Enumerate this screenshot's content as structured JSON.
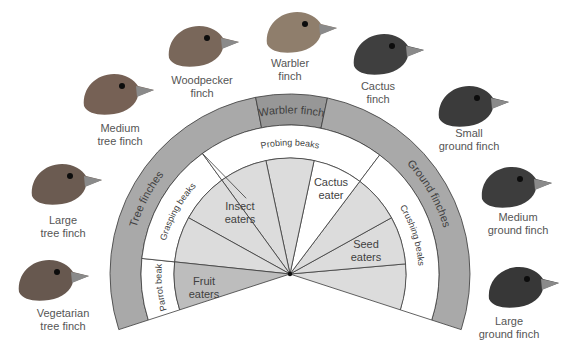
{
  "center": {
    "x": 290,
    "y": 274
  },
  "radii": {
    "outer": 180,
    "group_inner": 149,
    "beak_inner": 116
  },
  "colors": {
    "group_ring": "#a9a9a9",
    "warbler_band": "#979797",
    "diet_light": "#dcdcdc",
    "diet_fruit": "#bdbdbd",
    "white": "#ffffff",
    "stroke": "#3a3a3a",
    "label": "#3f3f3f"
  },
  "groups": [
    {
      "label": "Tree finches",
      "start": 101,
      "end": 198
    },
    {
      "label": "Warbler finch",
      "start": 78,
      "end": 101
    },
    {
      "label": "Ground finches",
      "start": -18,
      "end": 78
    }
  ],
  "beak_types": [
    {
      "label": "Parrot beak",
      "start": 174,
      "end": 198
    },
    {
      "label": "Grasping beaks",
      "start": 126,
      "end": 174
    },
    {
      "label": "Probing beaks",
      "start": 53,
      "end": 126
    },
    {
      "label": "Crushing beaks",
      "start": -18,
      "end": 53
    }
  ],
  "diet_wedges": [
    {
      "start": -18,
      "end": 5,
      "type": "seed"
    },
    {
      "start": 5,
      "end": 29,
      "type": "seed"
    },
    {
      "start": 29,
      "end": 53,
      "type": "seed"
    },
    {
      "start": 53,
      "end": 78,
      "type": "cactus"
    },
    {
      "start": 78,
      "end": 102,
      "type": "insect"
    },
    {
      "start": 102,
      "end": 126,
      "type": "insect"
    },
    {
      "start": 126,
      "end": 151,
      "type": "insect"
    },
    {
      "start": 151,
      "end": 174,
      "type": "insect"
    },
    {
      "start": 174,
      "end": 198,
      "type": "fruit"
    }
  ],
  "diet_labels": {
    "insect": [
      "Insect",
      "eaters"
    ],
    "cactus": [
      "Cactus",
      "eater"
    ],
    "seed": [
      "Seed",
      "eaters"
    ],
    "fruit": [
      "Fruit",
      "eaters"
    ]
  },
  "birds": [
    {
      "id": "woodpecker",
      "lines": [
        "Woodpecker",
        "finch"
      ],
      "label_x": 202,
      "label_y": 74,
      "head_x": 165,
      "head_y": 22,
      "tone": "#6e5a4c"
    },
    {
      "id": "warbler",
      "lines": [
        "Warbler",
        "finch"
      ],
      "label_x": 290,
      "label_y": 57,
      "head_x": 263,
      "head_y": 8,
      "tone": "#85735f"
    },
    {
      "id": "cactus",
      "lines": [
        "Cactus",
        "finch"
      ],
      "label_x": 378,
      "label_y": 80,
      "head_x": 350,
      "head_y": 30,
      "tone": "#2f2f2f"
    },
    {
      "id": "medium-tree",
      "lines": [
        "Medium",
        "tree finch"
      ],
      "label_x": 120,
      "label_y": 122,
      "head_x": 80,
      "head_y": 70,
      "tone": "#6a5446"
    },
    {
      "id": "small-ground",
      "lines": [
        "Small",
        "ground finch"
      ],
      "label_x": 469,
      "label_y": 127,
      "head_x": 435,
      "head_y": 82,
      "tone": "#2a2a2a"
    },
    {
      "id": "large-tree",
      "lines": [
        "Large",
        "tree finch"
      ],
      "label_x": 63,
      "label_y": 214,
      "head_x": 28,
      "head_y": 160,
      "tone": "#5e4d42"
    },
    {
      "id": "medium-ground",
      "lines": [
        "Medium",
        "ground finch"
      ],
      "label_x": 518,
      "label_y": 211,
      "head_x": 478,
      "head_y": 163,
      "tone": "#2d2d2d"
    },
    {
      "id": "vegetarian-tree",
      "lines": [
        "Vegetarian",
        "tree finch"
      ],
      "label_x": 63,
      "label_y": 307,
      "head_x": 15,
      "head_y": 256,
      "tone": "#5a4a40"
    },
    {
      "id": "large-ground",
      "lines": [
        "Large",
        "ground finch"
      ],
      "label_x": 509,
      "label_y": 315,
      "head_x": 485,
      "head_y": 263,
      "tone": "#262626"
    }
  ]
}
